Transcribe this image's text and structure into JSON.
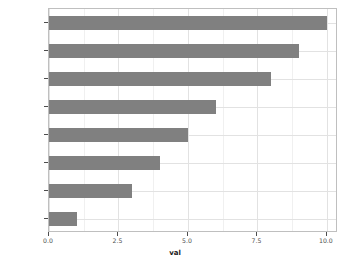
{
  "chart_data": {
    "type": "bar",
    "orientation": "horizontal",
    "title": "",
    "subtitle": "",
    "xlabel": "val",
    "ylabel": "",
    "categories": [
      "south-east",
      "east",
      "south",
      "north-west",
      "south-west",
      "west",
      "north",
      "north-east"
    ],
    "values": [
      10,
      9,
      8,
      6,
      5,
      4,
      3,
      1
    ],
    "xlim": [
      0,
      10.4
    ],
    "x_ticks": [
      0.0,
      2.5,
      5.0,
      7.5,
      10.0
    ],
    "x_tick_labels": [
      "0.0",
      "2.5",
      "5.0",
      "7.5",
      "10.0"
    ],
    "x_minor_ticks": [
      1.25,
      3.75,
      6.25,
      8.75
    ],
    "grid": true,
    "legend": "none",
    "bar_color": "#808080",
    "panel_background": "#ffffff",
    "grid_color": "#e2e2e2",
    "minor_grid_color": "#f0f0f0",
    "axis_text_color": "#4d4d4d",
    "panel_border_color": "#bfbfbf"
  }
}
